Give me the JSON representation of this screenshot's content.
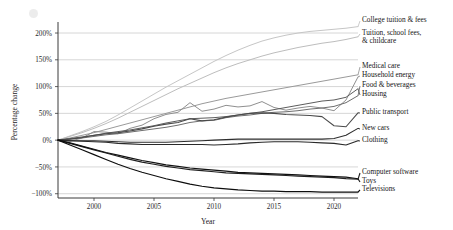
{
  "chart_data": {
    "type": "line",
    "title": "",
    "xlabel": "Year",
    "ylabel": "Percentage change",
    "xlim": [
      1997,
      2022
    ],
    "ylim": [
      -108,
      215
    ],
    "grid": true,
    "legend_position": "right-endpoint-labels",
    "xticks": [
      2000,
      2005,
      2010,
      2015,
      2020
    ],
    "xtick_labels": [
      "2000",
      "2005",
      "2010",
      "2015",
      "2020"
    ],
    "yticks": [
      -100,
      -50,
      0,
      50,
      100,
      150,
      200
    ],
    "ytick_labels": [
      "−100%",
      "−50%",
      "0%",
      "50%",
      "100%",
      "150%",
      "200%"
    ],
    "x": [
      1997,
      1998,
      1999,
      2000,
      2001,
      2002,
      2003,
      2004,
      2005,
      2006,
      2007,
      2008,
      2009,
      2010,
      2011,
      2012,
      2013,
      2014,
      2015,
      2016,
      2017,
      2018,
      2019,
      2020,
      2021,
      2022
    ],
    "series": [
      {
        "name": "College tuition & fees",
        "color": "#c6c6c6",
        "width": 1.0,
        "values": [
          0,
          8,
          16,
          25,
          35,
          47,
          60,
          73,
          86,
          99,
          111,
          123,
          135,
          147,
          158,
          168,
          177,
          185,
          191,
          196,
          200,
          203,
          205,
          207,
          209,
          212
        ]
      },
      {
        "name": "Tuition, school fees, & childcare",
        "color": "#bdbdbd",
        "width": 1.0,
        "values": [
          0,
          7,
          14,
          22,
          31,
          41,
          52,
          63,
          74,
          85,
          96,
          106,
          116,
          126,
          135,
          143,
          150,
          157,
          163,
          168,
          173,
          177,
          181,
          184,
          188,
          193
        ]
      },
      {
        "name": "Medical care",
        "color": "#9a9a9a",
        "width": 1.0,
        "values": [
          0,
          4,
          9,
          14,
          20,
          26,
          32,
          38,
          44,
          50,
          56,
          62,
          68,
          73,
          78,
          82,
          86,
          90,
          94,
          98,
          102,
          106,
          110,
          114,
          118,
          122
        ]
      },
      {
        "name": "Household energy",
        "color": "#8f8f8f",
        "width": 1.0,
        "values": [
          0,
          -2,
          4,
          16,
          15,
          12,
          22,
          28,
          40,
          48,
          52,
          70,
          54,
          58,
          65,
          62,
          64,
          72,
          61,
          56,
          60,
          63,
          60,
          55,
          75,
          118
        ]
      },
      {
        "name": "Food & beverages",
        "color": "#6e6e6e",
        "width": 1.0,
        "values": [
          0,
          2,
          4,
          7,
          10,
          12,
          15,
          18,
          21,
          24,
          28,
          33,
          36,
          37,
          42,
          45,
          47,
          50,
          52,
          53,
          55,
          58,
          60,
          63,
          70,
          83
        ]
      },
      {
        "name": "Housing",
        "color": "#5c5c5c",
        "width": 1.0,
        "values": [
          0,
          3,
          6,
          9,
          13,
          16,
          19,
          23,
          27,
          32,
          36,
          40,
          41,
          42,
          44,
          47,
          50,
          53,
          57,
          61,
          65,
          69,
          73,
          75,
          80,
          96
        ]
      },
      {
        "name": "Public transport",
        "color": "#4a4a4a",
        "width": 1.1,
        "values": [
          0,
          2,
          5,
          9,
          12,
          14,
          17,
          21,
          26,
          30,
          33,
          40,
          36,
          38,
          43,
          47,
          50,
          51,
          50,
          48,
          47,
          46,
          44,
          27,
          25,
          51
        ]
      },
      {
        "name": "New cars",
        "color": "#2e2e2e",
        "width": 1.1,
        "values": [
          0,
          -1,
          -1,
          -1,
          -2,
          -3,
          -4,
          -4,
          -4,
          -4,
          -3,
          -2,
          -1,
          0,
          1,
          2,
          2,
          2,
          2,
          2,
          2,
          2,
          2,
          3,
          9,
          22
        ]
      },
      {
        "name": "Clothing",
        "color": "#2a2a2a",
        "width": 1.1,
        "values": [
          0,
          -1,
          -2,
          -3,
          -4,
          -6,
          -7,
          -8,
          -8,
          -8,
          -8,
          -8,
          -8,
          -9,
          -8,
          -7,
          -5,
          -4,
          -3,
          -3,
          -3,
          -4,
          -5,
          -6,
          -9,
          -1
        ]
      },
      {
        "name": "Computer software",
        "color": "#202020",
        "width": 1.2,
        "values": [
          0,
          -6,
          -12,
          -18,
          -24,
          -30,
          -36,
          -41,
          -45,
          -49,
          -52,
          -55,
          -57,
          -59,
          -61,
          -62,
          -63,
          -64,
          -65,
          -66,
          -67,
          -68,
          -69,
          -70,
          -72,
          -73
        ]
      },
      {
        "name": "Toys",
        "color": "#111111",
        "width": 1.2,
        "values": [
          0,
          -5,
          -11,
          -17,
          -23,
          -28,
          -33,
          -38,
          -42,
          -46,
          -49,
          -52,
          -54,
          -56,
          -58,
          -60,
          -61,
          -62,
          -63,
          -64,
          -65,
          -66,
          -67,
          -68,
          -69,
          -72
        ]
      },
      {
        "name": "Televisions",
        "color": "#0d0d0d",
        "width": 1.2,
        "values": [
          0,
          -9,
          -18,
          -27,
          -36,
          -45,
          -53,
          -60,
          -66,
          -72,
          -77,
          -82,
          -86,
          -89,
          -91,
          -93,
          -94,
          -95,
          -95,
          -96,
          -96,
          -96,
          -97,
          -97,
          -97,
          -97
        ]
      }
    ],
    "label_blocks": [
      {
        "label": "College tuition & fees",
        "lines": [
          "College tuition & fees"
        ],
        "x": 362,
        "y": 16
      },
      {
        "label": "Tuition, school fees, & childcare",
        "lines": [
          "Tuition, school fees,",
          "& childcare"
        ],
        "x": 362,
        "y": 29
      },
      {
        "label": "Medical care",
        "lines": [
          "Medical care"
        ],
        "x": 362,
        "y": 62
      },
      {
        "label": "Household energy",
        "lines": [
          "Household energy"
        ],
        "x": 362,
        "y": 71
      },
      {
        "label": "Food & beverages",
        "lines": [
          "Food & beverages"
        ],
        "x": 362,
        "y": 81
      },
      {
        "label": "Housing",
        "lines": [
          "Housing"
        ],
        "x": 362,
        "y": 90
      },
      {
        "label": "Public transport",
        "lines": [
          "Public transport"
        ],
        "x": 362,
        "y": 108
      },
      {
        "label": "New cars",
        "lines": [
          "New cars"
        ],
        "x": 362,
        "y": 124
      },
      {
        "label": "Clothing",
        "lines": [
          "Clothing"
        ],
        "x": 362,
        "y": 136
      },
      {
        "label": "Computer software",
        "lines": [
          "Computer software"
        ],
        "x": 362,
        "y": 168
      },
      {
        "label": "Toys",
        "lines": [
          "Toys"
        ],
        "x": 362,
        "y": 177
      },
      {
        "label": "Televisions",
        "lines": [
          "Televisions"
        ],
        "x": 362,
        "y": 185
      }
    ]
  },
  "axes": {
    "ylabel": "Percentage change",
    "xlabel": "Year"
  }
}
